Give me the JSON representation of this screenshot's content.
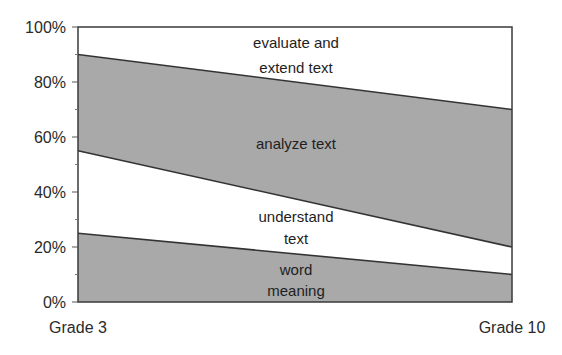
{
  "chart_data": {
    "type": "area",
    "stacked": true,
    "percent": true,
    "title": "",
    "xlabel": "",
    "ylabel": "",
    "categories": [
      "Grade 3",
      "Grade 10"
    ],
    "ylim": [
      0,
      100
    ],
    "yticks": [
      "0%",
      "20%",
      "40%",
      "60%",
      "80%",
      "100%"
    ],
    "ytick_values": [
      0,
      20,
      40,
      60,
      80,
      100
    ],
    "minor_ytick_values": [
      10,
      30,
      50,
      70,
      90
    ],
    "grid": false,
    "legend": "none (labels placed inside bands)",
    "series": [
      {
        "name": "word meaning",
        "label_lines": [
          "word",
          "meaning"
        ],
        "values": [
          25,
          10
        ],
        "fill": "#a9a9a9"
      },
      {
        "name": "understand text",
        "label_lines": [
          "understand",
          "text"
        ],
        "values": [
          30,
          10
        ],
        "fill": "#ffffff"
      },
      {
        "name": "analyze text",
        "label_lines": [
          "analyze text"
        ],
        "values": [
          35,
          50
        ],
        "fill": "#a9a9a9"
      },
      {
        "name": "evaluate and extend text",
        "label_lines": [
          "evaluate and",
          "extend text"
        ],
        "values": [
          10,
          30
        ],
        "fill": "#ffffff"
      }
    ],
    "cumulative_boundaries": {
      "Grade 3": [
        25,
        55,
        90,
        100
      ],
      "Grade 10": [
        10,
        20,
        70,
        100
      ]
    }
  },
  "colors": {
    "gray_band": "#a9a9a9",
    "white_band": "#ffffff",
    "line": "#333333",
    "text": "#222222"
  }
}
